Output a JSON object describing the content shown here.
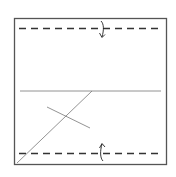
{
  "diagram": {
    "type": "origami-fold-step",
    "paper": {
      "x": 14,
      "y": 18,
      "width": 153,
      "height": 147,
      "stroke": "#555555"
    },
    "valley_folds": [
      {
        "name": "top-valley-fold",
        "y": 28,
        "x1": 19,
        "x2": 161
      },
      {
        "name": "bottom-valley-fold",
        "y": 153,
        "x1": 19,
        "x2": 161
      }
    ],
    "creases": [
      {
        "name": "horizontal-crease",
        "x1": 20,
        "y1": 91,
        "x2": 161,
        "y2": 91
      },
      {
        "name": "diagonal-crease",
        "x1": 17,
        "y1": 163,
        "x2": 92,
        "y2": 91
      },
      {
        "name": "short-cross-crease",
        "x1": 47,
        "y1": 107,
        "x2": 90,
        "y2": 128
      }
    ],
    "arrows": [
      {
        "name": "fold-down-arrow",
        "direction": "down",
        "x": 102,
        "y": 28
      },
      {
        "name": "fold-up-arrow",
        "direction": "up",
        "x": 102,
        "y": 153
      }
    ],
    "colors": {
      "line": "#555555",
      "dash": "#333333",
      "arrow": "#222222",
      "background": "#ffffff"
    }
  }
}
